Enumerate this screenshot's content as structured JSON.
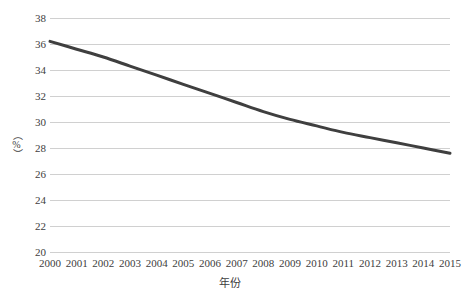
{
  "chart_data": {
    "type": "line",
    "title": "",
    "subtitle": "",
    "xlabel": "年份",
    "ylabel": "（%）",
    "x": [
      2000,
      2001,
      2002,
      2003,
      2004,
      2005,
      2006,
      2007,
      2008,
      2009,
      2010,
      2011,
      2012,
      2013,
      2014,
      2015
    ],
    "categories": [
      "2000",
      "2001",
      "2002",
      "2003",
      "2004",
      "2005",
      "2006",
      "2007",
      "2008",
      "2009",
      "2010",
      "2011",
      "2012",
      "2013",
      "2014",
      "2015"
    ],
    "series": [
      {
        "name": "",
        "values": [
          36.2,
          35.6,
          35.0,
          34.3,
          33.6,
          32.9,
          32.2,
          31.5,
          30.8,
          30.2,
          29.7,
          29.2,
          28.8,
          28.4,
          28.0,
          27.6
        ],
        "color": "#3f3f3f",
        "line_width": 3,
        "markers": false,
        "smooth": true
      }
    ],
    "ylim": [
      20,
      38
    ],
    "ytick_step": 2,
    "yticks": [
      38,
      36,
      34,
      32,
      30,
      28,
      26,
      24,
      22,
      20
    ],
    "ytick_labels": [
      "38",
      "36",
      "34",
      "32",
      "30",
      "28",
      "26",
      "24",
      "22",
      "20"
    ],
    "xlim": [
      2000,
      2015
    ],
    "grid": {
      "horizontal": true,
      "vertical": false,
      "color": "#d0d0d0"
    },
    "legend": {
      "visible": false,
      "position": "none",
      "entries": []
    },
    "annotations": [],
    "background_color": "#ffffff",
    "axis_label_color": "#404040"
  }
}
